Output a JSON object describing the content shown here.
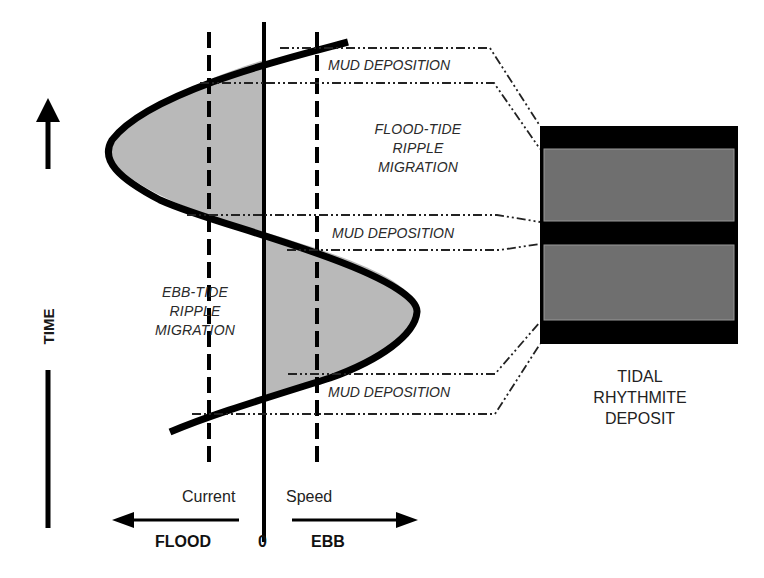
{
  "diagram": {
    "axes": {
      "time_label": "TIME",
      "x_label_left": "Current",
      "x_label_right": "Speed",
      "flood_label": "FLOOD",
      "zero_label": "0",
      "ebb_label": "EBB"
    },
    "regions": {
      "flood_tide": [
        "FLOOD-TIDE",
        "RIPPLE",
        "MIGRATION"
      ],
      "ebb_tide": [
        "EBB-TIDE",
        "RIPPLE",
        "MIGRATION"
      ],
      "mud_1": "MUD DEPOSITION",
      "mud_2": "MUD DEPOSITION",
      "mud_3": "MUD DEPOSITION"
    },
    "deposit": {
      "title": [
        "TIDAL",
        "RHYTHMITE",
        "DEPOSIT"
      ],
      "layers": [
        {
          "type": "mud",
          "color": "#000000"
        },
        {
          "type": "sand",
          "color": "#6f6f6f"
        },
        {
          "type": "mud",
          "color": "#000000"
        },
        {
          "type": "sand",
          "color": "#6f6f6f"
        },
        {
          "type": "mud",
          "color": "#000000"
        }
      ]
    },
    "colors": {
      "curve": "#000000",
      "shade": "#b9b9b9",
      "sand_layer": "#6f6f6f",
      "mud_layer": "#000000"
    }
  }
}
